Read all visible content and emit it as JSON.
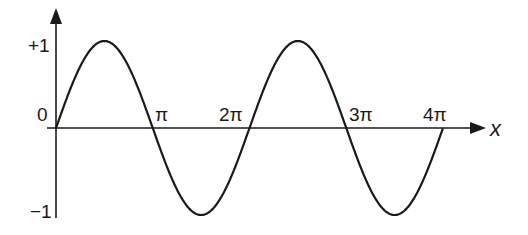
{
  "chart_data": {
    "type": "line",
    "title": "",
    "xlabel": "x",
    "ylabel": "",
    "function": "sin(x)",
    "xlim": [
      0,
      12.566
    ],
    "ylim": [
      -1,
      1
    ],
    "grid": false,
    "legend": null,
    "x_ticks": [
      {
        "value": 3.1416,
        "label": "π"
      },
      {
        "value": 6.2832,
        "label": "2π"
      },
      {
        "value": 9.4248,
        "label": "3π"
      },
      {
        "value": 12.5664,
        "label": "4π"
      }
    ],
    "y_ticks": [
      {
        "value": 1,
        "label": "+1"
      },
      {
        "value": 0,
        "label": "0"
      },
      {
        "value": -1,
        "label": "−1"
      }
    ],
    "series": [
      {
        "name": "sin(x)",
        "x": [
          0,
          1.5708,
          3.1416,
          4.7124,
          6.2832,
          7.854,
          9.4248,
          10.9956,
          12.5664
        ],
        "values": [
          0,
          1,
          0,
          -1,
          0,
          1,
          0,
          -1,
          0
        ]
      }
    ],
    "colors": {
      "curve": "#1a1a1a",
      "axes": "#1a1a1a"
    }
  },
  "labels": {
    "y_plus_one": "+1",
    "y_zero": "0",
    "y_minus_one": "−1",
    "x_pi": "π",
    "x_2pi": "2π",
    "x_3pi": "3π",
    "x_4pi": "4π",
    "x_axis": "x"
  }
}
